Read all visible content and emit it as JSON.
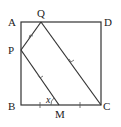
{
  "diagram": {
    "type": "geometry",
    "shape": "square ABCD",
    "points": {
      "A": {
        "label": "A",
        "x": 21,
        "y": 22
      },
      "Q": {
        "label": "Q",
        "x": 41,
        "y": 22
      },
      "D": {
        "label": "D",
        "x": 101,
        "y": 22
      },
      "P": {
        "label": "P",
        "x": 21,
        "y": 50
      },
      "B": {
        "label": "B",
        "x": 21,
        "y": 105
      },
      "M": {
        "label": "M",
        "x": 59,
        "y": 105
      },
      "C": {
        "label": "C",
        "x": 101,
        "y": 105
      }
    },
    "segments": [
      "AB",
      "BC",
      "CD",
      "DA",
      "PQ",
      "PM",
      "QC"
    ],
    "angle_label": "x"
  }
}
